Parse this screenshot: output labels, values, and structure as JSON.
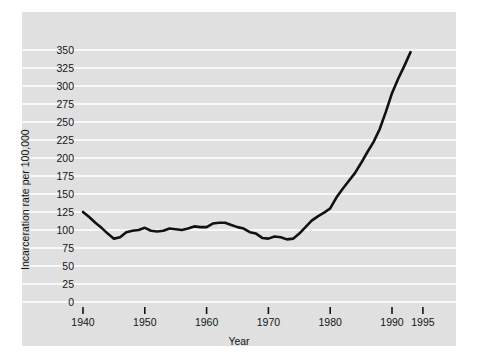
{
  "chart_data": {
    "type": "line",
    "title": "",
    "xlabel": "Year",
    "ylabel": "Incarceration rate per 100,000",
    "xlim": [
      1938,
      1996
    ],
    "ylim": [
      0,
      355
    ],
    "grid": true,
    "legend": false,
    "legend_position": "none",
    "line_color": "#111111",
    "panel_color": "#e3e3e3",
    "gridline_color": "#ffffff",
    "x_ticks": [
      1940,
      1950,
      1960,
      1970,
      1980,
      1990,
      1995
    ],
    "x_tick_labels": [
      "1940",
      "1950",
      "1960",
      "1970",
      "1980",
      "1990",
      "1995"
    ],
    "y_ticks": [
      0,
      25,
      50,
      75,
      100,
      125,
      150,
      175,
      200,
      225,
      250,
      275,
      300,
      325,
      350
    ],
    "y_tick_labels": [
      "0",
      "25",
      "50",
      "75",
      "100",
      "125",
      "150",
      "175",
      "200",
      "225",
      "250",
      "275",
      "300",
      "325",
      "350"
    ],
    "x": [
      1940,
      1941,
      1942,
      1943,
      1944,
      1945,
      1946,
      1947,
      1948,
      1949,
      1950,
      1951,
      1952,
      1953,
      1954,
      1955,
      1956,
      1957,
      1958,
      1959,
      1960,
      1961,
      1962,
      1963,
      1964,
      1965,
      1966,
      1967,
      1968,
      1969,
      1970,
      1971,
      1972,
      1973,
      1974,
      1975,
      1976,
      1977,
      1978,
      1979,
      1980,
      1981,
      1982,
      1983,
      1984,
      1985,
      1986,
      1987,
      1988,
      1989,
      1990,
      1991,
      1992,
      1993
    ],
    "values": [
      125,
      118,
      110,
      103,
      95,
      88,
      90,
      97,
      99,
      100,
      103,
      99,
      98,
      99,
      102,
      101,
      100,
      102,
      105,
      104,
      104,
      109,
      110,
      110,
      107,
      104,
      102,
      97,
      95,
      89,
      88,
      91,
      90,
      87,
      88,
      95,
      104,
      113,
      119,
      124,
      130,
      145,
      157,
      168,
      179,
      193,
      208,
      222,
      240,
      264,
      290,
      310,
      328,
      347
    ],
    "series_name": "Incarceration rate per 100,000",
    "annotations": []
  },
  "axes": {
    "y_axis_title": "Incarceration rate per 100,000",
    "x_axis_title": "Year"
  }
}
